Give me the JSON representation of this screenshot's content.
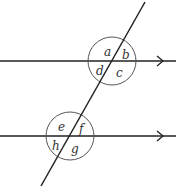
{
  "diagram": {
    "type": "parallel-lines-transversal",
    "colors": {
      "line": "#222222",
      "circle": "#555555",
      "label": "#333333",
      "background": "#ffffff"
    },
    "parallel_lines": [
      {
        "id": "top",
        "y": 61,
        "x1": 0,
        "x2": 176,
        "arrow_x": 163
      },
      {
        "id": "bottom",
        "y": 136,
        "x1": 0,
        "x2": 176,
        "arrow_x": 163
      }
    ],
    "transversal": {
      "x1": 145,
      "y1": 2,
      "x2": 41,
      "y2": 186
    },
    "intersections": [
      {
        "id": "top",
        "circle": {
          "cx": 112,
          "cy": 61,
          "r": 24
        },
        "angles": [
          {
            "label": "a",
            "x": 104,
            "y": 56
          },
          {
            "label": "b",
            "x": 122,
            "y": 59
          },
          {
            "label": "c",
            "x": 116,
            "y": 77
          },
          {
            "label": "d",
            "x": 96,
            "y": 75
          }
        ]
      },
      {
        "id": "bottom",
        "circle": {
          "cx": 70,
          "cy": 136,
          "r": 24
        },
        "angles": [
          {
            "label": "e",
            "x": 58,
            "y": 131
          },
          {
            "label": "f",
            "x": 79,
            "y": 133
          },
          {
            "label": "g",
            "x": 71,
            "y": 153
          },
          {
            "label": "h",
            "x": 52,
            "y": 150
          }
        ]
      }
    ]
  }
}
